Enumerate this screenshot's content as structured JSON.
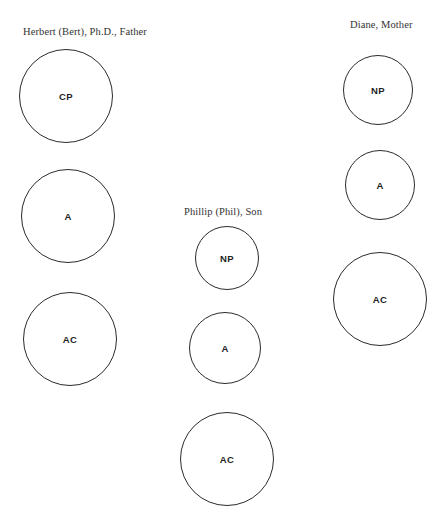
{
  "diagram": {
    "type": "family-ego-state-circles",
    "persons": [
      {
        "id": "herbert",
        "label": "Herbert (Bert), Ph.D., Father",
        "label_pos": {
          "x": 23,
          "y": 26
        },
        "circles": [
          {
            "state": "CP",
            "cx": 66,
            "cy": 96,
            "r": 47
          },
          {
            "state": "A",
            "cx": 68,
            "cy": 216,
            "r": 47
          },
          {
            "state": "AC",
            "cx": 70,
            "cy": 339,
            "r": 47
          }
        ]
      },
      {
        "id": "phillip",
        "label": "Phillip (Phil), Son",
        "label_pos": {
          "x": 184,
          "y": 206
        },
        "circles": [
          {
            "state": "NP",
            "cx": 227,
            "cy": 258,
            "r": 32
          },
          {
            "state": "A",
            "cx": 225,
            "cy": 348,
            "r": 36
          },
          {
            "state": "AC",
            "cx": 227,
            "cy": 459,
            "r": 47
          }
        ]
      },
      {
        "id": "diane",
        "label": "Diane, Mother",
        "label_pos": {
          "x": 350,
          "y": 19
        },
        "circles": [
          {
            "state": "NP",
            "cx": 378,
            "cy": 90,
            "r": 35
          },
          {
            "state": "A",
            "cx": 380,
            "cy": 185,
            "r": 35
          },
          {
            "state": "AC",
            "cx": 380,
            "cy": 299,
            "r": 47
          }
        ]
      }
    ]
  }
}
